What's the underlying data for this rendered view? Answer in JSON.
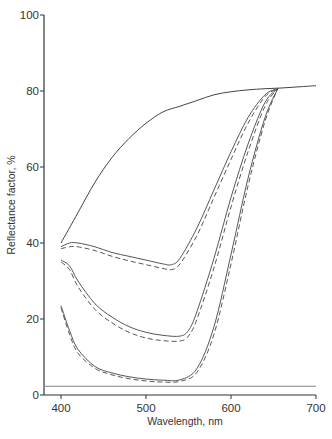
{
  "chart_data": {
    "type": "line",
    "title": "",
    "xlabel": "Wavelength, nm",
    "ylabel": "Reflectance factor, %",
    "xlim": [
      380,
      700
    ],
    "ylim": [
      0,
      100
    ],
    "x_ticks": [
      400,
      500,
      600,
      700
    ],
    "y_ticks": [
      0,
      20,
      40,
      60,
      80,
      100
    ],
    "grid": false,
    "legend": null,
    "series": [
      {
        "name": "top-solid",
        "style": "solid",
        "x": [
          400,
          420,
          440,
          460,
          480,
          500,
          520,
          540,
          560,
          580,
          600,
          620,
          640,
          660,
          680,
          700
        ],
        "y": [
          40,
          48,
          56,
          62.5,
          67.5,
          71.5,
          74.5,
          76,
          77.5,
          79,
          79.8,
          80.3,
          80.6,
          80.8,
          81.1,
          81.4
        ]
      },
      {
        "name": "curve-1-solid",
        "style": "solid",
        "x": [
          400,
          410,
          420,
          440,
          460,
          480,
          500,
          520,
          530,
          540,
          560,
          580,
          600,
          620,
          640,
          655
        ],
        "y": [
          39,
          40,
          40,
          39,
          37.5,
          36.5,
          35.5,
          34.5,
          34.3,
          36,
          44,
          54,
          64,
          73,
          79,
          80.6
        ]
      },
      {
        "name": "curve-1-dashed",
        "style": "dashed",
        "x": [
          400,
          410,
          420,
          440,
          460,
          480,
          500,
          520,
          530,
          540,
          560,
          580,
          600,
          620,
          640,
          655
        ],
        "y": [
          38.5,
          39,
          39,
          38,
          36.5,
          35.3,
          34.3,
          33.3,
          33,
          34.5,
          42,
          52,
          62,
          71.5,
          78.5,
          80.6
        ]
      },
      {
        "name": "curve-2-solid",
        "style": "solid",
        "x": [
          400,
          410,
          420,
          440,
          460,
          480,
          500,
          520,
          540,
          550,
          560,
          580,
          600,
          620,
          640,
          655
        ],
        "y": [
          35.5,
          34,
          30,
          24,
          20.5,
          18,
          16.5,
          15.7,
          15.5,
          17,
          22,
          36,
          52,
          66,
          77,
          80.6
        ]
      },
      {
        "name": "curve-2-dashed",
        "style": "dashed",
        "x": [
          400,
          410,
          420,
          440,
          460,
          480,
          500,
          520,
          540,
          550,
          560,
          580,
          600,
          620,
          640,
          655
        ],
        "y": [
          35,
          33,
          28.5,
          22.5,
          19,
          16.5,
          15,
          14.3,
          14.2,
          15.5,
          20,
          33.5,
          49.5,
          64,
          76,
          80.6
        ]
      },
      {
        "name": "curve-3-solid",
        "style": "solid",
        "x": [
          400,
          410,
          420,
          440,
          460,
          480,
          500,
          520,
          540,
          560,
          580,
          600,
          620,
          640,
          655
        ],
        "y": [
          23.5,
          17,
          12,
          7.5,
          5.8,
          4.8,
          4.2,
          3.9,
          4,
          7,
          18,
          37,
          57,
          73,
          80.6
        ]
      },
      {
        "name": "curve-3-dashed",
        "style": "dashed",
        "x": [
          400,
          410,
          420,
          440,
          460,
          480,
          500,
          520,
          540,
          560,
          580,
          600,
          620,
          640,
          655
        ],
        "y": [
          23,
          16,
          11,
          7,
          5.3,
          4.3,
          3.7,
          3.4,
          3.6,
          6,
          16,
          34.5,
          55,
          72,
          80.6
        ]
      },
      {
        "name": "baseline",
        "style": "solid",
        "x": [
          380,
          700
        ],
        "y": [
          2.3,
          2.3
        ]
      }
    ]
  }
}
